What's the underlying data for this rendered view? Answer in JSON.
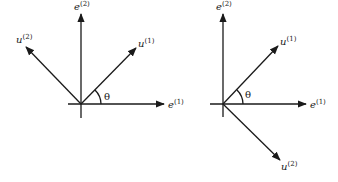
{
  "diagrams": [
    {
      "name": "left",
      "origin": [
        81,
        104
      ],
      "axes": {
        "e1": {
          "label": "e",
          "sup": "(1)"
        },
        "e2": {
          "label": "e",
          "sup": "(2)"
        }
      },
      "vectors": {
        "u1": {
          "label": "u",
          "sup": "(1)",
          "direction": "up-right"
        },
        "u2": {
          "label": "u",
          "sup": "(2)",
          "direction": "up-left"
        }
      },
      "angle_label": "θ"
    },
    {
      "name": "right",
      "origin": [
        223,
        104
      ],
      "axes": {
        "e1": {
          "label": "e",
          "sup": "(1)"
        },
        "e2": {
          "label": "e",
          "sup": "(2)"
        }
      },
      "vectors": {
        "u1": {
          "label": "u",
          "sup": "(1)",
          "direction": "up-right"
        },
        "u2": {
          "label": "u",
          "sup": "(2)",
          "direction": "down-right"
        }
      },
      "angle_label": "θ"
    }
  ]
}
